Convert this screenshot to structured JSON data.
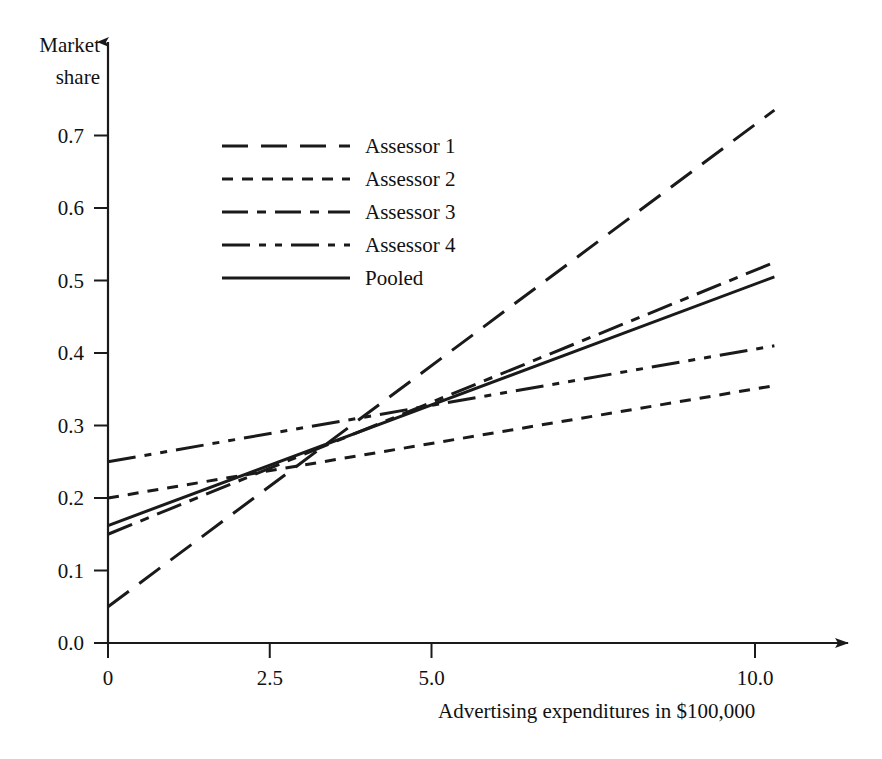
{
  "chart_data": {
    "type": "line",
    "title": "",
    "xlabel": "Advertising expenditures in $100,000",
    "ylabel": "Market share",
    "ylabel_line1": "Market",
    "ylabel_line2": "share",
    "xlim": [
      0,
      11.0
    ],
    "ylim": [
      0.0,
      0.75
    ],
    "grid": false,
    "legend_position": "upper-left-inside",
    "xticks": [
      0,
      2.5,
      5.0,
      10.0
    ],
    "xtick_labels": [
      "0",
      "2.5",
      "5.0",
      "10.0"
    ],
    "yticks": [
      0.0,
      0.1,
      0.2,
      0.3,
      0.4,
      0.5,
      0.6,
      0.7
    ],
    "ytick_labels": [
      "0.0",
      "0.1",
      "0.2",
      "0.3",
      "0.4",
      "0.5",
      "0.6",
      "0.7"
    ],
    "x": [
      0,
      10.3
    ],
    "series": [
      {
        "name": "Assessor 1",
        "dash": "long-dash",
        "dasharray": "26 13",
        "values": [
          0.05,
          0.735
        ],
        "intercept": 0.05,
        "slope": 0.0665
      },
      {
        "name": "Assessor 2",
        "dash": "short-dash",
        "dasharray": "11 9",
        "values": [
          0.2,
          0.355
        ],
        "intercept": 0.2,
        "slope": 0.015
      },
      {
        "name": "Assessor 3",
        "dash": "dash-dot",
        "dasharray": "26 9 9 9",
        "values": [
          0.15,
          0.525
        ],
        "intercept": 0.15,
        "slope": 0.0364
      },
      {
        "name": "Assessor 4",
        "dash": "dash-dot-dot",
        "dasharray": "28 9 7 9 7 9",
        "values": [
          0.25,
          0.41
        ],
        "intercept": 0.25,
        "slope": 0.0155
      },
      {
        "name": "Pooled",
        "dash": "solid",
        "dasharray": "none",
        "values": [
          0.162,
          0.505
        ],
        "intercept": 0.162,
        "slope": 0.0333
      }
    ],
    "legend_entries": [
      {
        "label": "Assessor 1",
        "dasharray": "26 13"
      },
      {
        "label": "Assessor 2",
        "dasharray": "11 9"
      },
      {
        "label": "Assessor 3",
        "dasharray": "26 9 9 9"
      },
      {
        "label": "Assessor 4",
        "dasharray": "28 9 7 9 7 9"
      },
      {
        "label": "Pooled",
        "dasharray": "none"
      }
    ],
    "line_color": "#1a1a1a",
    "background_color": "#ffffff"
  }
}
